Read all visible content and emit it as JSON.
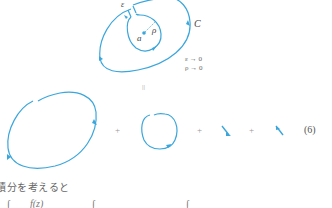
{
  "figure": {
    "accent_color": "#3aa6dc",
    "labels": {
      "epsilon": "ε",
      "rho": "ρ",
      "point": "a",
      "contour": "C"
    },
    "limits": {
      "line1": "ε → 0",
      "line2": "ρ → 0"
    },
    "equals_sign": "||",
    "plus_signs": [
      "+",
      "+",
      "+"
    ],
    "equation_number": "(6)"
  },
  "text": {
    "jp_line": "積分を考えると",
    "bottom_fragments": [
      "∫",
      "f(z)",
      "∫",
      "∫"
    ]
  }
}
